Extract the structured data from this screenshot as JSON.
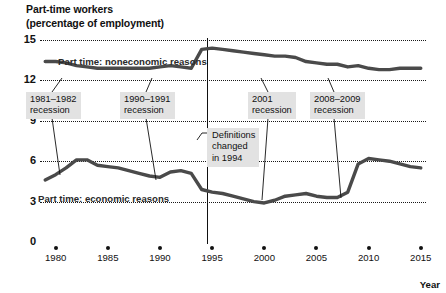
{
  "title": {
    "line1": "Part-time workers",
    "line2": "(percentage of employment)"
  },
  "axes": {
    "y_ticks": [
      "15",
      "12",
      "9",
      "6",
      "3",
      "0"
    ],
    "x_ticks": [
      "1980",
      "1985",
      "1990",
      "1995",
      "2000",
      "2005",
      "2010",
      "2015"
    ],
    "x_axis_title": "Year",
    "ylim": [
      0,
      15
    ],
    "xlim": [
      1978.5,
      2015.5
    ]
  },
  "series_labels": {
    "noneconomic": "Part time: noneconomic reasons",
    "economic": "Part time: economic reasons"
  },
  "annotations": {
    "recession_1981": {
      "line1": "1981–1982",
      "line2": "recession"
    },
    "recession_1990": {
      "line1": "1990–1991",
      "line2": "recession"
    },
    "recession_2001": {
      "line1": "2001",
      "line2": "recession"
    },
    "recession_2008": {
      "line1": "2008–2009",
      "line2": "recession"
    },
    "definitions": {
      "line1": "Definitions",
      "line2": "changed",
      "line3": "in 1994"
    }
  },
  "colors": {
    "line": "#4a4a4a",
    "grid": "#1a1a1a",
    "callout_bg": "#e2e2e2",
    "text": "#111111",
    "background": "#ffffff"
  },
  "chart_data": {
    "type": "line",
    "title": "Part-time workers (percentage of employment)",
    "xlabel": "Year",
    "ylabel": "percentage of employment",
    "ylim": [
      0,
      15
    ],
    "xlim": [
      1978.5,
      2015.5
    ],
    "yticks": [
      0,
      3,
      6,
      9,
      12,
      15
    ],
    "xticks": [
      1980,
      1985,
      1990,
      1995,
      2000,
      2005,
      2010,
      2015
    ],
    "grid": "horizontal dotted",
    "legend": "inline series labels",
    "x": [
      1979,
      1980,
      1981,
      1982,
      1983,
      1984,
      1985,
      1986,
      1987,
      1988,
      1989,
      1990,
      1991,
      1992,
      1993,
      1994,
      1995,
      1996,
      1997,
      1998,
      1999,
      2000,
      2001,
      2002,
      2003,
      2004,
      2005,
      2006,
      2007,
      2008,
      2009,
      2010,
      2011,
      2012,
      2013,
      2014,
      2015
    ],
    "series": [
      {
        "name": "Part time: noneconomic reasons",
        "values": [
          13.4,
          13.4,
          13.3,
          13.1,
          13.0,
          12.9,
          12.9,
          12.9,
          12.9,
          12.9,
          12.9,
          13.0,
          13.1,
          13.0,
          12.9,
          14.3,
          14.4,
          14.3,
          14.2,
          14.1,
          14.0,
          13.9,
          13.8,
          13.8,
          13.7,
          13.4,
          13.3,
          13.2,
          13.2,
          13.0,
          13.1,
          12.9,
          12.8,
          12.8,
          12.9,
          12.9,
          12.9
        ]
      },
      {
        "name": "Part time: economic reasons",
        "values": [
          4.6,
          5.0,
          5.5,
          6.1,
          6.1,
          5.7,
          5.6,
          5.5,
          5.3,
          5.1,
          4.9,
          4.8,
          5.2,
          5.3,
          5.1,
          3.9,
          3.7,
          3.6,
          3.4,
          3.2,
          3.0,
          2.9,
          3.1,
          3.4,
          3.5,
          3.6,
          3.4,
          3.3,
          3.3,
          3.7,
          5.8,
          6.2,
          6.1,
          6.0,
          5.8,
          5.6,
          5.5
        ]
      }
    ],
    "notes": [
      "Vertical rule at 1994 marks a change in survey definitions",
      "Recession callouts: 1981–1982, 1990–1991, 2001, 2008–2009"
    ]
  }
}
